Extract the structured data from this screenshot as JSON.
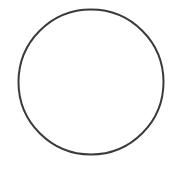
{
  "canvas": {
    "width": 170,
    "height": 173,
    "background": "#ffffff"
  },
  "shapes": [
    {
      "type": "circle",
      "name": "circle",
      "cx": 91,
      "cy": 82,
      "r": 72.5,
      "stroke": "#3a3a3a",
      "stroke_width": 2,
      "fill": "none"
    }
  ]
}
